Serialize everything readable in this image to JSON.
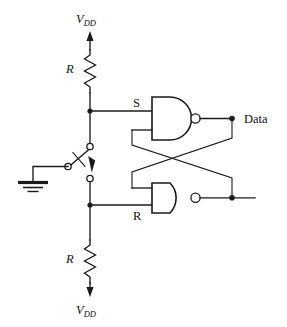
{
  "figure": {
    "line_color": "#1b1b1b",
    "background": "#ffffff"
  },
  "labels": {
    "supply_top": "V",
    "supply_top_sub": "DD",
    "supply_bottom": "V",
    "supply_bottom_sub": "DD",
    "resistor_top": "R",
    "resistor_bottom": "R",
    "set_input": "S",
    "reset_input": "R",
    "output_data": "Data"
  },
  "components": [
    {
      "id": "r-top",
      "type": "resistor",
      "label": "R",
      "orientation": "vertical"
    },
    {
      "id": "r-bottom",
      "type": "resistor",
      "label": "R",
      "orientation": "vertical"
    },
    {
      "id": "sw",
      "type": "spdt-switch",
      "label": ""
    },
    {
      "id": "gnd",
      "type": "ground",
      "label": ""
    },
    {
      "id": "nand-top",
      "type": "nand-gate",
      "label": "S"
    },
    {
      "id": "nand-bottom",
      "type": "nand-gate",
      "label": "R"
    }
  ],
  "nets": [
    {
      "name": "vdd-top",
      "label": "V_DD"
    },
    {
      "name": "set-node",
      "label": "S"
    },
    {
      "name": "reset-node",
      "label": "R"
    },
    {
      "name": "q-out",
      "label": "Data"
    },
    {
      "name": "qbar-out",
      "label": ""
    },
    {
      "name": "vdd-bottom",
      "label": "V_DD"
    }
  ]
}
